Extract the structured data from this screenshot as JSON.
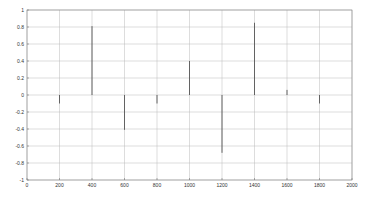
{
  "chart_data": {
    "type": "stem",
    "title": "",
    "xlabel": "",
    "ylabel": "",
    "xlim": [
      0,
      2000
    ],
    "ylim": [
      -1,
      1
    ],
    "grid": true,
    "legend": null,
    "x": [
      200,
      400,
      600,
      800,
      1000,
      1200,
      1400,
      1600,
      1800
    ],
    "values": [
      -0.1,
      0.81,
      -0.41,
      -0.1,
      0.4,
      -0.68,
      0.85,
      0.06,
      -0.1
    ],
    "x_ticks": [
      "0",
      "200",
      "400",
      "600",
      "800",
      "1000",
      "1200",
      "1400",
      "1600",
      "1800",
      "2000"
    ],
    "y_ticks": [
      "1",
      "0.8",
      "0.6",
      "0.4",
      "0.2",
      "0",
      "-0.2",
      "-0.4",
      "-0.6",
      "-0.8",
      "-1"
    ],
    "colors": {
      "stem": "#555555",
      "grid": "#bbbbbb",
      "axis": "#666666"
    }
  }
}
